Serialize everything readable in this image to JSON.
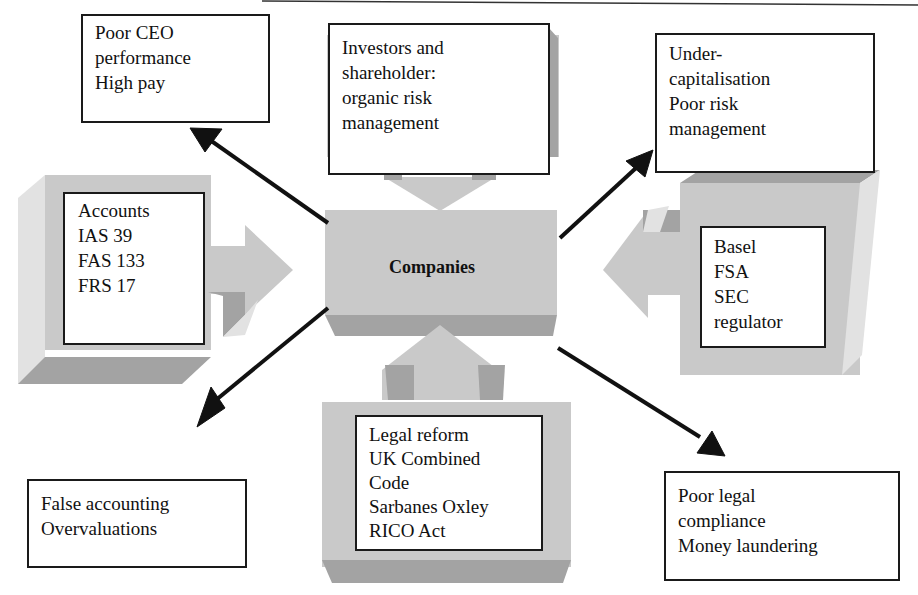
{
  "diagram": {
    "type": "hub-and-spoke",
    "center": {
      "label": "Companies"
    },
    "inputs": [
      {
        "id": "investors",
        "position": "top",
        "lines": [
          "Investors and",
          "shareholder:",
          "organic risk",
          "management"
        ]
      },
      {
        "id": "accounts",
        "position": "left",
        "lines": [
          "Accounts",
          "IAS 39",
          "FAS 133",
          "FRS 17"
        ]
      },
      {
        "id": "regulators",
        "position": "right",
        "lines": [
          "Basel",
          "FSA",
          "SEC",
          "regulator"
        ]
      },
      {
        "id": "legal",
        "position": "bottom",
        "lines": [
          "Legal reform",
          "UK Combined",
          "Code",
          "Sarbanes Oxley",
          "RICO Act"
        ]
      }
    ],
    "outputs": [
      {
        "id": "ceo",
        "position": "top-left",
        "lines": [
          "Poor CEO",
          "performance",
          "High pay"
        ]
      },
      {
        "id": "capital",
        "position": "top-right",
        "lines": [
          "Under-",
          "capitalisation",
          "Poor risk",
          "management"
        ]
      },
      {
        "id": "false-accounting",
        "position": "bottom-left",
        "lines": [
          "False accounting",
          "Overvaluations"
        ]
      },
      {
        "id": "compliance",
        "position": "bottom-right",
        "lines": [
          "Poor legal",
          "compliance",
          "Money laundering"
        ]
      }
    ],
    "colors": {
      "block_face": "#c9c9c9",
      "block_shadow": "#a3a3a3",
      "block_highlight": "#e2e2e2",
      "arrow": "#111111",
      "box_border": "#1a1a1a"
    }
  }
}
